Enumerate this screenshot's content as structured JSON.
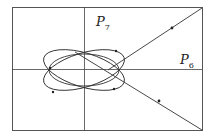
{
  "diagram": {
    "labels": {
      "p7": {
        "main": "P",
        "sub": "7"
      },
      "p6": {
        "main": "P",
        "sub": "6"
      }
    },
    "colors": {
      "stroke": "#333333",
      "frame": "#555555",
      "background": "#ffffff"
    }
  }
}
